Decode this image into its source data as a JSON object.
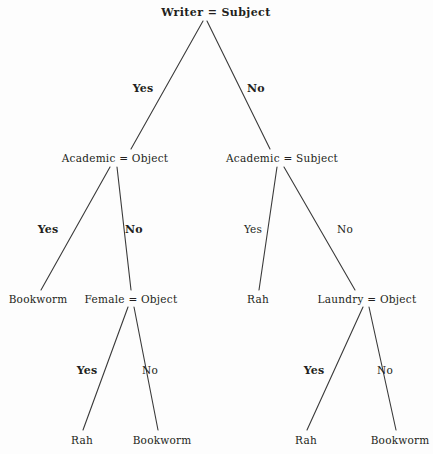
{
  "diagram": {
    "type": "decision-tree",
    "title": "Writer = Subject",
    "background_color": "#fdfdfd",
    "line_color": "#3a3a3a",
    "text_color": "#231f20"
  },
  "nodes": {
    "root": {
      "label": "Writer = Subject",
      "x": 216,
      "y": 12
    },
    "l1_left": {
      "label": "Academic = Object",
      "x": 115,
      "y": 158
    },
    "l1_right": {
      "label": "Academic = Subject",
      "x": 282,
      "y": 158
    },
    "l2_a": {
      "label": "Bookworm",
      "x": 38,
      "y": 299
    },
    "l2_b": {
      "label": "Female = Object",
      "x": 131,
      "y": 299
    },
    "l2_c": {
      "label": "Rah",
      "x": 258,
      "y": 299
    },
    "l2_d": {
      "label": "Laundry = Object",
      "x": 367,
      "y": 299
    },
    "l3_a": {
      "label": "Rah",
      "x": 82,
      "y": 440
    },
    "l3_b": {
      "label": "Bookworm",
      "x": 162,
      "y": 440
    },
    "l3_c": {
      "label": "Rah",
      "x": 306,
      "y": 440
    },
    "l3_d": {
      "label": "Bookworm",
      "x": 400,
      "y": 440
    }
  },
  "edge_labels": [
    {
      "text": "Yes",
      "x": 143,
      "y": 88,
      "strong": true
    },
    {
      "text": "No",
      "x": 256,
      "y": 88,
      "strong": true
    },
    {
      "text": "Yes",
      "x": 48,
      "y": 229,
      "strong": true
    },
    {
      "text": "No",
      "x": 134,
      "y": 229,
      "strong": true
    },
    {
      "text": "Yes",
      "x": 253,
      "y": 229,
      "strong": false
    },
    {
      "text": "No",
      "x": 345,
      "y": 229,
      "strong": false
    },
    {
      "text": "Yes",
      "x": 87,
      "y": 370,
      "strong": true
    },
    {
      "text": "No",
      "x": 150,
      "y": 370,
      "strong": false
    },
    {
      "text": "Yes",
      "x": 314,
      "y": 370,
      "strong": true
    },
    {
      "text": "No",
      "x": 385,
      "y": 370,
      "strong": false
    }
  ],
  "edges": [
    {
      "from": "root",
      "to": "l1_left",
      "x1": 203,
      "y1": 21,
      "x2": 131,
      "y2": 149
    },
    {
      "from": "root",
      "to": "l1_right",
      "x1": 207,
      "y1": 21,
      "x2": 270,
      "y2": 149
    },
    {
      "from": "l1_left",
      "to": "l2_a",
      "x1": 110,
      "y1": 167,
      "x2": 41,
      "y2": 290
    },
    {
      "from": "l1_left",
      "to": "l2_b",
      "x1": 117,
      "y1": 167,
      "x2": 131,
      "y2": 290
    },
    {
      "from": "l1_right",
      "to": "l2_c",
      "x1": 277,
      "y1": 167,
      "x2": 259,
      "y2": 290
    },
    {
      "from": "l1_right",
      "to": "l2_d",
      "x1": 284,
      "y1": 167,
      "x2": 355,
      "y2": 290
    },
    {
      "from": "l2_b",
      "to": "l3_a",
      "x1": 128,
      "y1": 307,
      "x2": 83,
      "y2": 430
    },
    {
      "from": "l2_b",
      "to": "l3_b",
      "x1": 134,
      "y1": 307,
      "x2": 158,
      "y2": 430
    },
    {
      "from": "l2_d",
      "to": "l3_c",
      "x1": 363,
      "y1": 307,
      "x2": 307,
      "y2": 430
    },
    {
      "from": "l2_d",
      "to": "l3_d",
      "x1": 369,
      "y1": 307,
      "x2": 396,
      "y2": 430
    }
  ],
  "chart_data": {
    "type": "tree",
    "title": "Writer = Subject",
    "root": {
      "test": "Writer = Subject",
      "branches": [
        {
          "answer": "Yes",
          "node": {
            "test": "Academic = Object",
            "branches": [
              {
                "answer": "Yes",
                "node": {
                  "leaf": "Bookworm"
                }
              },
              {
                "answer": "No",
                "node": {
                  "test": "Female = Object",
                  "branches": [
                    {
                      "answer": "Yes",
                      "node": {
                        "leaf": "Rah"
                      }
                    },
                    {
                      "answer": "No",
                      "node": {
                        "leaf": "Bookworm"
                      }
                    }
                  ]
                }
              }
            ]
          }
        },
        {
          "answer": "No",
          "node": {
            "test": "Academic = Subject",
            "branches": [
              {
                "answer": "Yes",
                "node": {
                  "leaf": "Rah"
                }
              },
              {
                "answer": "No",
                "node": {
                  "test": "Laundry = Object",
                  "branches": [
                    {
                      "answer": "Yes",
                      "node": {
                        "leaf": "Rah"
                      }
                    },
                    {
                      "answer": "No",
                      "node": {
                        "leaf": "Bookworm"
                      }
                    }
                  ]
                }
              }
            ]
          }
        }
      ]
    },
    "classes": [
      "Bookworm",
      "Rah"
    ],
    "attributes": [
      "Writer = Subject",
      "Academic = Object",
      "Academic = Subject",
      "Female = Object",
      "Laundry = Object"
    ],
    "branch_labels": [
      "Yes",
      "No"
    ],
    "depth": 4,
    "leaf_count": 6
  }
}
